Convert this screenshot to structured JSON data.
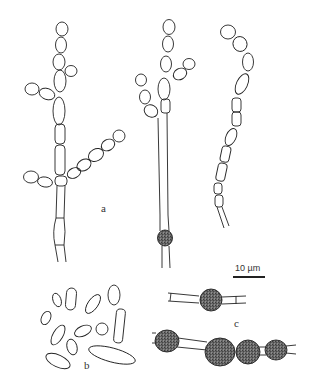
{
  "figure": {
    "panels": [
      {
        "id": "a",
        "label": "a",
        "description": "branched conidiophores with chains of conidia and an intercalary chlamydospore"
      },
      {
        "id": "b",
        "label": "b",
        "description": "conidia of varied shapes"
      },
      {
        "id": "c",
        "label": "c",
        "description": "intercalary chlamydospores in hyphae"
      }
    ],
    "scale_bar": {
      "label": "10 µm"
    },
    "colors": {
      "line": "#222222",
      "stipple": "#777777",
      "background": "#ffffff"
    }
  }
}
